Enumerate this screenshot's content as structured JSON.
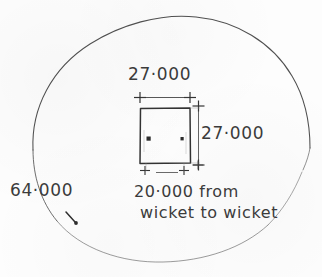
{
  "drawing": {
    "title": "Cricket ground boundary and pitch dimension sketch",
    "medium": "hand-drawn pencil sketch on paper",
    "ink_color": "#3b3b3b",
    "paper_color": "#fdfdfd"
  },
  "labels": {
    "top_width": "27·000",
    "right_height": "27·000",
    "boundary_radius": "64·000",
    "pitch_length_line1": "20·000 from",
    "pitch_length_line2": "wicket to wicket"
  },
  "shapes": {
    "boundary_circle_name": "boundary-circle",
    "inner_square_name": "pitch-square",
    "wicket_mark_left": "wicket-mark-left",
    "wicket_mark_right": "wicket-mark-right",
    "radius_tick": "boundary-radius-tick"
  },
  "dimension_lines": [
    {
      "name": "top-width-dimension",
      "orientation": "horizontal",
      "value": "27·000"
    },
    {
      "name": "right-height-dimension",
      "orientation": "vertical",
      "value": "27·000"
    },
    {
      "name": "bottom-pitch-dimension",
      "orientation": "horizontal",
      "value": "20·000"
    }
  ]
}
